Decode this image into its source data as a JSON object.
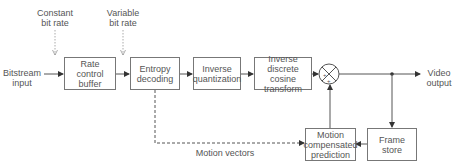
{
  "diagram": {
    "inputs": {
      "bitstream_input": "Bitstream\ninput",
      "constant_bit_rate": "Constant\nbit rate",
      "variable_bit_rate": "Variable\nbit rate"
    },
    "blocks": [
      {
        "id": "rate-control-buffer",
        "label": "Rate\ncontrol\nbuffer"
      },
      {
        "id": "entropy-decoding",
        "label": "Entropy\ndecoding"
      },
      {
        "id": "inverse-quantization",
        "label": "Inverse\nquantization"
      },
      {
        "id": "inverse-dct",
        "label": "Inverse\ndiscrete cosine\ntransform"
      },
      {
        "id": "motion-compensated-prediction",
        "label": "Motion\ncompensated\nprediction"
      },
      {
        "id": "frame-store",
        "label": "Frame\nstore"
      }
    ],
    "summer": {
      "signs": [
        "+",
        "+"
      ]
    },
    "outputs": {
      "video_output": "Video\noutput"
    },
    "edge_labels": {
      "motion_vectors": "Motion vectors"
    },
    "colors": {
      "line": "#555555",
      "box_border": "#777777",
      "text": "#555555",
      "dotted_arrow": "#999999"
    }
  }
}
